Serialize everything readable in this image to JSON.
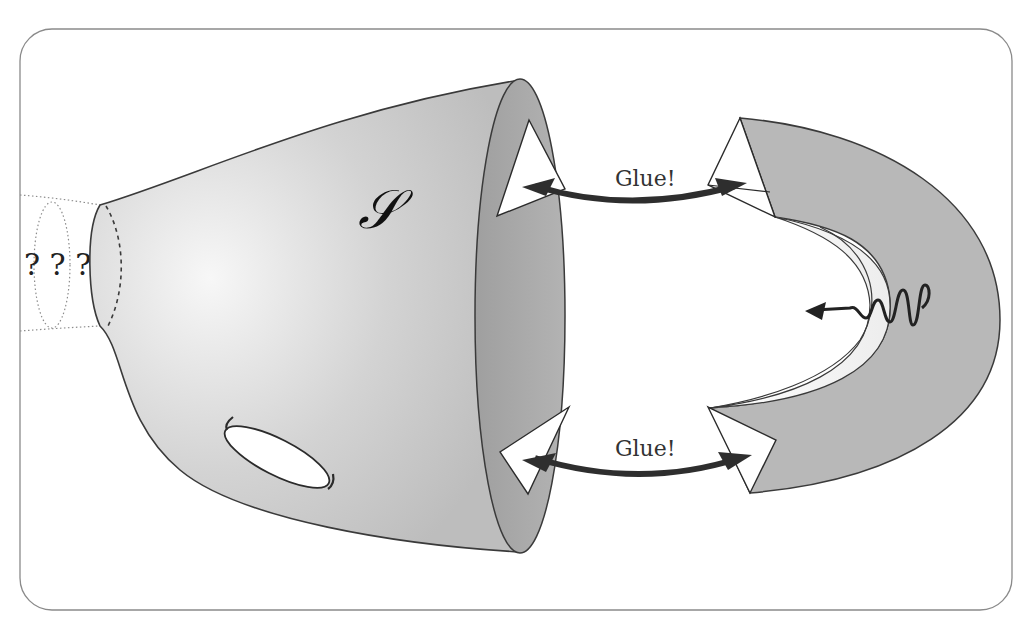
{
  "figure": {
    "surface_label": "𝒮",
    "unknown_label": "? ? ?",
    "glue_top_label": "Glue!",
    "glue_bottom_label": "Glue!"
  },
  "colors": {
    "frame_stroke": "#8a8a8a",
    "surface_fill_light": "#f4f4f4",
    "surface_fill_dark": "#b9b9b9",
    "mouth_fill": "#a9a9a9",
    "handle_fill": "#b8b8b8",
    "handle_inner_fill": "#f2f2f2",
    "arrow_color": "#2e2e2e",
    "outline": "#3a3a3a"
  },
  "elements": [
    {
      "name": "surface-S",
      "type": "truncated-cone-with-hole"
    },
    {
      "name": "boundary-triangle-top",
      "type": "triangle"
    },
    {
      "name": "boundary-triangle-bottom",
      "type": "triangle"
    },
    {
      "name": "u-shaped-handle",
      "type": "half-annulus-band"
    },
    {
      "name": "glue-arrow-top",
      "type": "double-arrow"
    },
    {
      "name": "glue-arrow-bottom",
      "type": "double-arrow"
    },
    {
      "name": "wavy-arrow",
      "type": "squiggle-arrow"
    },
    {
      "name": "unknown-extension",
      "type": "dotted-tube"
    }
  ]
}
